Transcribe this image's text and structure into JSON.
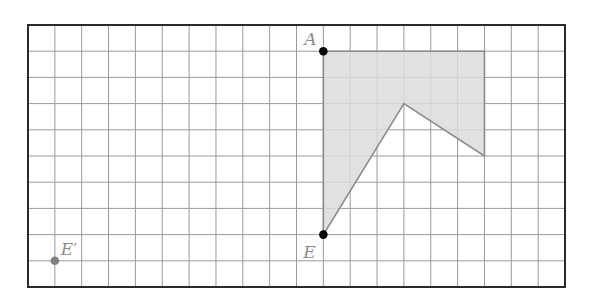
{
  "diagram": {
    "type": "grid-figure",
    "grid": {
      "columns": 20,
      "rows": 10
    },
    "colors": {
      "grid_line": "#9a9a9a",
      "border": "#2a2a2a",
      "shape_fill": "#dcdcdc",
      "shape_edge": "#8c8c8c",
      "point": "#000000",
      "image_point": "#808080",
      "label": "#8a8a8a"
    },
    "shape": {
      "name": "shaded-polygon",
      "vertices": [
        [
          11,
          1
        ],
        [
          17,
          1
        ],
        [
          17,
          5
        ],
        [
          14,
          3
        ],
        [
          11,
          8
        ]
      ]
    },
    "points": [
      {
        "id": "A",
        "label": "A",
        "at": [
          11,
          1
        ],
        "style": "filled-black",
        "label_pos": "upper-left"
      },
      {
        "id": "E",
        "label": "E",
        "at": [
          11,
          8
        ],
        "style": "filled-black",
        "label_pos": "lower-left"
      },
      {
        "id": "E-prime",
        "label": "E′",
        "at": [
          1,
          9
        ],
        "style": "filled-gray",
        "label_pos": "upper-right"
      }
    ]
  }
}
